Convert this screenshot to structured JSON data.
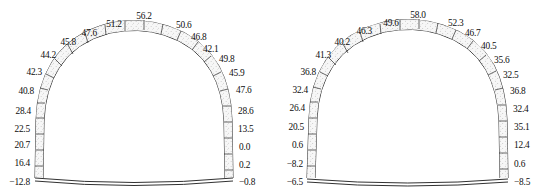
{
  "figure": {
    "type": "engineering-drawing",
    "panel_count": 2,
    "stroke_color": "#1a1a1a",
    "lining_fill": "#f2f2f2"
  },
  "chart_data": {
    "type": "table",
    "title": "",
    "xlabel": "",
    "ylabel": "",
    "panels": [
      {
        "name": "left-section",
        "labels": [
          {
            "id": "l-left-1",
            "value": "−12.8",
            "x": 30,
            "y": 183,
            "align": "r"
          },
          {
            "id": "l-left-2",
            "value": "16.4",
            "x": 30,
            "y": 164,
            "align": "r"
          },
          {
            "id": "l-left-3",
            "value": "20.7",
            "x": 30,
            "y": 146,
            "align": "r"
          },
          {
            "id": "l-left-4",
            "value": "22.5",
            "x": 30,
            "y": 130,
            "align": "r"
          },
          {
            "id": "l-left-5",
            "value": "28.4",
            "x": 31,
            "y": 112,
            "align": "r"
          },
          {
            "id": "l-left-6",
            "value": "40.8",
            "x": 34,
            "y": 92,
            "align": "r"
          },
          {
            "id": "l-left-7",
            "value": "42.3",
            "x": 42,
            "y": 73,
            "align": "r"
          },
          {
            "id": "l-left-8",
            "value": "44.2",
            "x": 56,
            "y": 56,
            "align": "r"
          },
          {
            "id": "l-left-9",
            "value": "45.8",
            "x": 76,
            "y": 43,
            "align": "r"
          },
          {
            "id": "l-crown-1",
            "value": "47.6",
            "x": 97,
            "y": 34,
            "align": "r"
          },
          {
            "id": "l-crown-2",
            "value": "51.2",
            "x": 114,
            "y": 25,
            "align": "c"
          },
          {
            "id": "l-crown-3",
            "value": "56.2",
            "x": 144,
            "y": 17,
            "align": "c"
          },
          {
            "id": "l-crown-4",
            "value": "50.6",
            "x": 176,
            "y": 26,
            "align": "l"
          },
          {
            "id": "l-right-1",
            "value": "46.8",
            "x": 191,
            "y": 38,
            "align": "l"
          },
          {
            "id": "l-right-2",
            "value": "42.1",
            "x": 203,
            "y": 50,
            "align": "l"
          },
          {
            "id": "l-right-3",
            "value": "49.8",
            "x": 219,
            "y": 60,
            "align": "l"
          },
          {
            "id": "l-right-4",
            "value": "45.9",
            "x": 229,
            "y": 74,
            "align": "l"
          },
          {
            "id": "l-right-5",
            "value": "47.6",
            "x": 236,
            "y": 91,
            "align": "l"
          },
          {
            "id": "l-right-6",
            "value": "28.6",
            "x": 238,
            "y": 112,
            "align": "l"
          },
          {
            "id": "l-right-7",
            "value": "13.5",
            "x": 238,
            "y": 130,
            "align": "l"
          },
          {
            "id": "l-right-8",
            "value": "0.0",
            "x": 239,
            "y": 148,
            "align": "l"
          },
          {
            "id": "l-right-9",
            "value": "0.2",
            "x": 239,
            "y": 166,
            "align": "l"
          },
          {
            "id": "l-right-10",
            "value": "−0.8",
            "x": 239,
            "y": 183,
            "align": "l"
          }
        ]
      },
      {
        "name": "right-section",
        "labels": [
          {
            "id": "r-left-1",
            "value": "−6.5",
            "x": 29,
            "y": 183,
            "align": "r"
          },
          {
            "id": "r-left-2",
            "value": "−8.2",
            "x": 29,
            "y": 165,
            "align": "r"
          },
          {
            "id": "r-left-3",
            "value": "0.6",
            "x": 29,
            "y": 146,
            "align": "r"
          },
          {
            "id": "r-left-4",
            "value": "20.5",
            "x": 30,
            "y": 128,
            "align": "r"
          },
          {
            "id": "r-left-5",
            "value": "26.4",
            "x": 31,
            "y": 109,
            "align": "r"
          },
          {
            "id": "r-left-6",
            "value": "32.4",
            "x": 34,
            "y": 91,
            "align": "r"
          },
          {
            "id": "r-left-7",
            "value": "36.8",
            "x": 42,
            "y": 73,
            "align": "r"
          },
          {
            "id": "r-left-8",
            "value": "41.3",
            "x": 57,
            "y": 56,
            "align": "r"
          },
          {
            "id": "r-left-9",
            "value": "40.2",
            "x": 76,
            "y": 43,
            "align": "r"
          },
          {
            "id": "r-crown-1",
            "value": "46.3",
            "x": 98,
            "y": 32,
            "align": "r"
          },
          {
            "id": "r-crown-2",
            "value": "49.6",
            "x": 117,
            "y": 24,
            "align": "c"
          },
          {
            "id": "r-crown-3",
            "value": "58.0",
            "x": 144,
            "y": 16,
            "align": "c"
          },
          {
            "id": "r-crown-4",
            "value": "52.3",
            "x": 174,
            "y": 24,
            "align": "l"
          },
          {
            "id": "r-right-1",
            "value": "46.7",
            "x": 191,
            "y": 34,
            "align": "l"
          },
          {
            "id": "r-right-2",
            "value": "40.5",
            "x": 207,
            "y": 47,
            "align": "l"
          },
          {
            "id": "r-right-3",
            "value": "35.6",
            "x": 220,
            "y": 61,
            "align": "l"
          },
          {
            "id": "r-right-4",
            "value": "32.5",
            "x": 229,
            "y": 76,
            "align": "l"
          },
          {
            "id": "r-right-5",
            "value": "36.8",
            "x": 236,
            "y": 92,
            "align": "l"
          },
          {
            "id": "r-right-6",
            "value": "32.4",
            "x": 239,
            "y": 110,
            "align": "l"
          },
          {
            "id": "r-right-7",
            "value": "35.1",
            "x": 240,
            "y": 128,
            "align": "l"
          },
          {
            "id": "r-right-8",
            "value": "12.4",
            "x": 240,
            "y": 146,
            "align": "l"
          },
          {
            "id": "r-right-9",
            "value": "0.6",
            "x": 240,
            "y": 165,
            "align": "l"
          },
          {
            "id": "r-right-10",
            "value": "−8.5",
            "x": 240,
            "y": 183,
            "align": "l"
          }
        ]
      }
    ]
  }
}
